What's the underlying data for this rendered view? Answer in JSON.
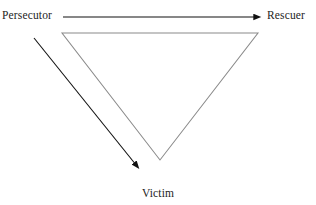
{
  "diagram": {
    "name": "drama-triangle",
    "background_color": "#ffffff",
    "triangle_stroke_color": "#8a8a8a",
    "arrow_stroke_color": "#111111",
    "label_color": "#1d1d1d",
    "roles": {
      "persecutor": "Persecutor",
      "rescuer": "Rescuer",
      "victim": "Victim"
    },
    "arrows": [
      {
        "name": "persecutor-to-rescuer-arrow",
        "from": "Persecutor",
        "to": "Rescuer",
        "direction": "right",
        "x1": 63,
        "y1": 17,
        "x2": 256,
        "y2": 17
      },
      {
        "name": "persecutor-to-victim-arrow",
        "from": "Persecutor",
        "to": "Victim",
        "direction": "down-right",
        "x1": 34,
        "y1": 38,
        "x2": 136,
        "y2": 165
      }
    ],
    "triangle": {
      "name": "inverted-triangle",
      "vertices": [
        {
          "label": "Persecutor",
          "x": 62,
          "y": 33
        },
        {
          "label": "Rescuer",
          "x": 258,
          "y": 33
        },
        {
          "label": "Victim",
          "x": 160,
          "y": 160
        }
      ]
    }
  }
}
